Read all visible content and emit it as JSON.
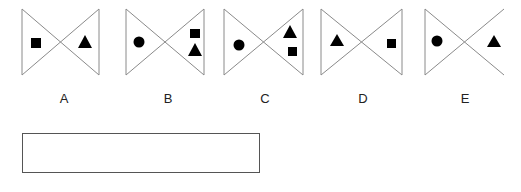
{
  "figures": [
    {
      "label": "A",
      "x": 22,
      "width": 77,
      "right_edge": true,
      "shapes": [
        {
          "type": "square",
          "side": "left",
          "cx": 36,
          "cy": 43
        },
        {
          "type": "triangle",
          "side": "right",
          "cx": 85,
          "cy": 42
        }
      ]
    },
    {
      "label": "B",
      "x": 126,
      "width": 78,
      "right_edge": true,
      "shapes": [
        {
          "type": "circle",
          "side": "left",
          "cx": 139,
          "cy": 42
        },
        {
          "type": "square",
          "side": "right",
          "cx": 195,
          "cy": 33
        },
        {
          "type": "triangle",
          "side": "right",
          "cx": 195,
          "cy": 50
        }
      ]
    },
    {
      "label": "C",
      "x": 224,
      "width": 79,
      "right_edge": true,
      "shapes": [
        {
          "type": "circle",
          "side": "left",
          "cx": 239,
          "cy": 45
        },
        {
          "type": "triangle",
          "side": "right",
          "cx": 290,
          "cy": 32
        },
        {
          "type": "square",
          "side": "right",
          "cx": 292,
          "cy": 51
        }
      ]
    },
    {
      "label": "D",
      "x": 321,
      "width": 81,
      "right_edge": true,
      "shapes": [
        {
          "type": "triangle",
          "side": "left",
          "cx": 337,
          "cy": 41
        },
        {
          "type": "square",
          "side": "right",
          "cx": 391,
          "cy": 43
        }
      ]
    },
    {
      "label": "E",
      "x": 425,
      "width": 79,
      "right_edge": false,
      "shapes": [
        {
          "type": "circle",
          "side": "left",
          "cx": 437,
          "cy": 41
        },
        {
          "type": "triangle",
          "side": "right",
          "cx": 494,
          "cy": 42
        }
      ]
    }
  ],
  "geometry": {
    "top": 9,
    "bottom": 75
  },
  "labels": {
    "a": "A",
    "b": "B",
    "c": "C",
    "d": "D",
    "e": "E"
  },
  "answer_box": {
    "value": ""
  },
  "colors": {
    "line": "#8a8a8a",
    "shape": "#000000",
    "box_border": "#555555"
  }
}
